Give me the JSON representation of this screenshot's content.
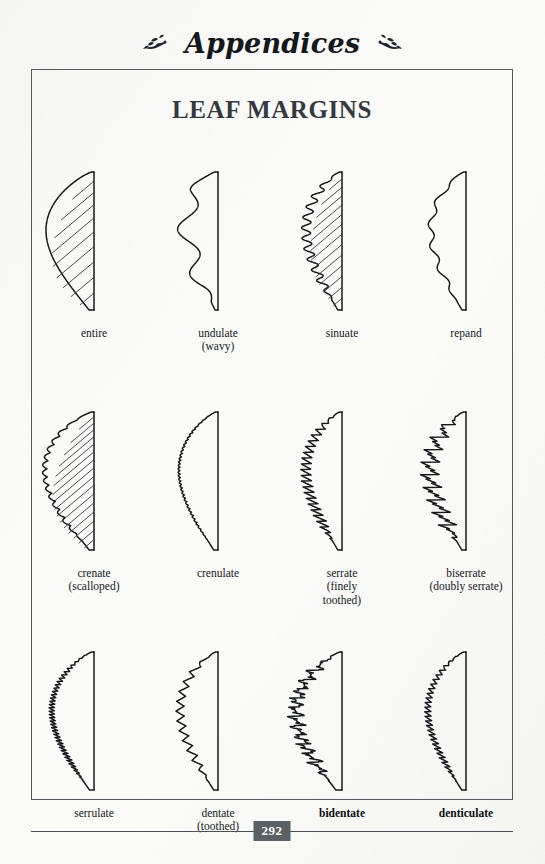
{
  "running_head": {
    "title": "Appendices",
    "ornament_left": "leaf-vine-ornament",
    "ornament_right": "leaf-vine-ornament"
  },
  "sheet": {
    "title": "LEAF MARGINS"
  },
  "folio": {
    "page_number": "292"
  },
  "colors": {
    "paper": "#fbfbfa",
    "ink": "#17191b",
    "frame": "#54585c",
    "title": "#35393d",
    "folio_badge": "#5b6064",
    "folio_text": "#ffffff"
  },
  "figures": [
    {
      "id": "entire",
      "label": "entire",
      "sub": "",
      "bold": false,
      "style": "smooth",
      "veins": true,
      "vein_count": 9,
      "width": 46,
      "amplitude": 0,
      "teeth": 0
    },
    {
      "id": "undulate",
      "label": "undulate",
      "sub": "(wavy)",
      "bold": false,
      "style": "wave-large",
      "veins": false,
      "vein_count": 0,
      "width": 30,
      "amplitude": 9,
      "teeth": 3
    },
    {
      "id": "sinuate",
      "label": "sinuate",
      "sub": "",
      "bold": false,
      "style": "wave-small",
      "veins": true,
      "vein_count": 13,
      "width": 34,
      "amplitude": 4.5,
      "teeth": 13
    },
    {
      "id": "repand",
      "label": "repand",
      "sub": "",
      "bold": false,
      "style": "wave-shallow",
      "veins": false,
      "vein_count": 0,
      "width": 33,
      "amplitude": 3,
      "teeth": 6
    },
    {
      "id": "crenate",
      "label": "crenate",
      "sub": "(scalloped)",
      "bold": false,
      "style": "scallop",
      "veins": true,
      "vein_count": 16,
      "width": 45,
      "amplitude": 5,
      "teeth": 17
    },
    {
      "id": "crenulate",
      "label": "crenulate",
      "sub": "",
      "bold": false,
      "style": "scallop-fine",
      "veins": false,
      "vein_count": 0,
      "width": 36,
      "amplitude": 2,
      "teeth": 40
    },
    {
      "id": "serrate",
      "label": "serrate",
      "sub": "(finely\ntoothed)",
      "bold": false,
      "style": "serrate",
      "veins": false,
      "vein_count": 0,
      "width": 34,
      "amplitude": 5.5,
      "teeth": 24
    },
    {
      "id": "biserrate",
      "label": "biserrate",
      "sub": "(doubly serrate)",
      "bold": false,
      "style": "biserrate",
      "veins": false,
      "vein_count": 0,
      "width": 34,
      "amplitude": 8,
      "teeth": 11
    },
    {
      "id": "serrulate",
      "label": "serrulate",
      "sub": "",
      "bold": false,
      "style": "serrulate",
      "veins": false,
      "vein_count": 0,
      "width": 40,
      "amplitude": 3,
      "teeth": 42
    },
    {
      "id": "dentate",
      "label": "dentate",
      "sub": "(toothed)",
      "bold": false,
      "style": "dentate",
      "veins": false,
      "vein_count": 0,
      "width": 36,
      "amplitude": 8,
      "teeth": 14
    },
    {
      "id": "bidentate",
      "label": "bidentate",
      "sub": "",
      "bold": true,
      "style": "bidentate",
      "veins": false,
      "vein_count": 0,
      "width": 44,
      "amplitude": 7,
      "teeth": 15
    },
    {
      "id": "denticulate",
      "label": "denticulate",
      "sub": "",
      "bold": true,
      "style": "denticulate",
      "veins": false,
      "vein_count": 0,
      "width": 36,
      "amplitude": 4,
      "teeth": 30
    }
  ]
}
